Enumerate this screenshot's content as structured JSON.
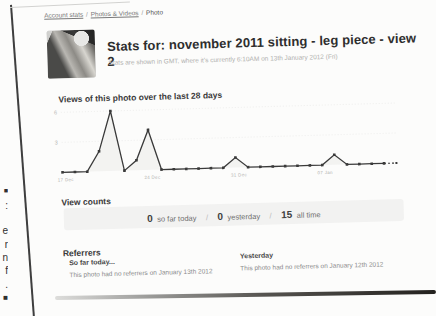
{
  "breadcrumb": {
    "items": [
      {
        "label": "Account stats"
      },
      {
        "label": "Photos & Videos"
      },
      {
        "label": "Photo"
      }
    ],
    "separator": "/"
  },
  "header": {
    "title": "Stats for: november 2011 sitting - leg piece - view 2",
    "subtitle": "Stats are shown in GMT, where it's currently 6:10AM on 13th January 2012 (Fri)"
  },
  "sections": {
    "views_heading": "Views of this photo over the last 28 days",
    "counts_heading": "View counts",
    "referrers_heading": "Referrers"
  },
  "view_counts": {
    "today_value": "0",
    "today_label": "so far today",
    "yesterday_value": "0",
    "yesterday_label": "yesterday",
    "alltime_value": "15",
    "alltime_label": "all time",
    "separator": "/"
  },
  "referrers": {
    "today": {
      "title": "So far today...",
      "text": "This photo had no referrers on January 13th 2012"
    },
    "yesterday": {
      "title": "Yesterday",
      "text": "This photo had no referrers on January 12th 2012"
    }
  },
  "edge_fragments": [
    "■",
    ":",
    "e",
    "r",
    "n",
    "f",
    ".",
    "■"
  ],
  "chart_data": {
    "type": "line",
    "title": "Views of this photo over the last 28 days",
    "categories": [
      "17 Dec",
      "18 Dec",
      "19 Dec",
      "20 Dec",
      "21 Dec",
      "22 Dec",
      "23 Dec",
      "24 Dec",
      "25 Dec",
      "26 Dec",
      "27 Dec",
      "28 Dec",
      "29 Dec",
      "30 Dec",
      "31 Dec",
      "01 Jan",
      "02 Jan",
      "03 Jan",
      "04 Jan",
      "05 Jan",
      "06 Jan",
      "07 Jan",
      "08 Jan",
      "09 Jan",
      "10 Jan",
      "11 Jan",
      "12 Jan",
      "13 Jan"
    ],
    "values": [
      0,
      0,
      0,
      2,
      6,
      0,
      1,
      4,
      0,
      0,
      0,
      0,
      0,
      0,
      1,
      0,
      0,
      0,
      0,
      0,
      0,
      0,
      1,
      0,
      0,
      0,
      0,
      0
    ],
    "xticks": [
      {
        "index": 0,
        "label": "17 Dec"
      },
      {
        "index": 7,
        "label": "24 Dec"
      },
      {
        "index": 14,
        "label": "31 Dec"
      },
      {
        "index": 21,
        "label": "07 Jan"
      }
    ],
    "yticks": [
      3,
      6
    ],
    "ylim": [
      0,
      6.6
    ],
    "grid": "faint-dotted",
    "legend": false,
    "last_segment_dashed": true,
    "line_color": "#3a3a3a",
    "area_color": "#f0f0ef",
    "tick_color": "#b8b8b6"
  }
}
